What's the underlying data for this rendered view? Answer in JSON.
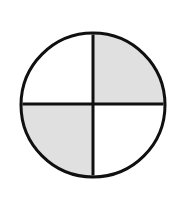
{
  "figure": {
    "name": "fraction-circle-two-quarters",
    "canvas": {
      "width": 179,
      "height": 200,
      "background_color": "#FFFFFF"
    },
    "circle": {
      "center_x": 93,
      "center_y": 105,
      "radius": 72,
      "stroke_color": "#101010",
      "stroke_width": 3,
      "fill_color": "#FFFFFF"
    },
    "dividers": [
      {
        "name": "vertical-diameter",
        "orientation": "vertical",
        "position_x": 93,
        "stroke_color": "#101010",
        "stroke_width": 3
      },
      {
        "name": "horizontal-diameter",
        "orientation": "horizontal",
        "position_y": 104,
        "stroke_color": "#101010",
        "stroke_width": 3
      }
    ],
    "texture": {
      "name": "speckled-gray-noise",
      "base_color": "#A8A8A8",
      "light_speck_color": "#C4C4C4",
      "dark_speck_color": "#8A8A8A",
      "grain_size_px": 1
    },
    "quadrants": [
      {
        "name": "top-left-quadrant",
        "position": "top-left",
        "shaded": false,
        "fill": "white"
      },
      {
        "name": "top-right-quadrant",
        "position": "top-right",
        "shaded": true,
        "fill": "speckled-gray"
      },
      {
        "name": "bottom-left-quadrant",
        "position": "bottom-left",
        "shaded": true,
        "fill": "speckled-gray"
      },
      {
        "name": "bottom-right-quadrant",
        "position": "bottom-right",
        "shaded": false,
        "fill": "white"
      }
    ],
    "fraction": {
      "shaded_parts": 2,
      "total_parts": 4,
      "label": ""
    }
  }
}
